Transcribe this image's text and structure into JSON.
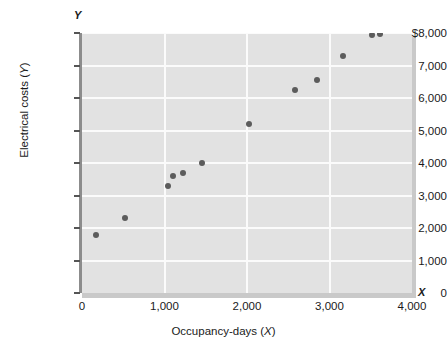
{
  "chart_data": {
    "type": "scatter",
    "title": "",
    "xlabel": "Occupancy-days (X)",
    "ylabel": "Electrical costs (Y)",
    "x_axis_symbol": "X",
    "y_axis_symbol": "Y",
    "xlim": [
      0,
      4000
    ],
    "ylim": [
      0,
      8000
    ],
    "grid": true,
    "legend": null,
    "xticks": [
      0,
      1000,
      2000,
      3000,
      4000
    ],
    "xtick_labels": [
      "0",
      "1,000",
      "2,000",
      "3,000",
      "4,000"
    ],
    "yticks": [
      0,
      1000,
      2000,
      3000,
      4000,
      5000,
      6000,
      7000,
      8000
    ],
    "ytick_labels": [
      "0",
      "1,000",
      "2,000",
      "3,000",
      "4,000",
      "5,000",
      "6,000",
      "7,000",
      "$8,000"
    ],
    "marker_color": "#5c5c5c",
    "plot_background": "#e2e2e2",
    "gridline_color": "#fbfbfb",
    "points": [
      {
        "x": 175,
        "y": 1800
      },
      {
        "x": 520,
        "y": 2300
      },
      {
        "x": 1040,
        "y": 3300
      },
      {
        "x": 1100,
        "y": 3600
      },
      {
        "x": 1220,
        "y": 3700
      },
      {
        "x": 1450,
        "y": 4000
      },
      {
        "x": 2030,
        "y": 5200
      },
      {
        "x": 2580,
        "y": 6250
      },
      {
        "x": 2850,
        "y": 6550
      },
      {
        "x": 3160,
        "y": 7300
      },
      {
        "x": 3520,
        "y": 7930
      },
      {
        "x": 3610,
        "y": 7980
      }
    ]
  }
}
